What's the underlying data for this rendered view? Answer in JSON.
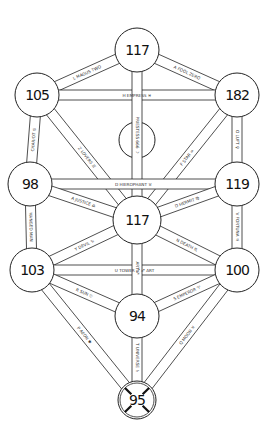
{
  "diagram": {
    "type": "tree-of-life",
    "nodes": [
      {
        "id": "n1",
        "value": "117",
        "x": 137,
        "y": 50,
        "r": 22
      },
      {
        "id": "n2",
        "value": "182",
        "x": 237,
        "y": 95,
        "r": 22
      },
      {
        "id": "n3",
        "value": "105",
        "x": 37,
        "y": 95,
        "r": 22
      },
      {
        "id": "n4",
        "value": "119",
        "x": 237,
        "y": 184,
        "r": 22
      },
      {
        "id": "n5",
        "value": "98",
        "x": 30,
        "y": 184,
        "r": 22
      },
      {
        "id": "n6",
        "value": "117",
        "x": 137,
        "y": 220,
        "r": 24
      },
      {
        "id": "n7",
        "value": "100",
        "x": 237,
        "y": 270,
        "r": 22
      },
      {
        "id": "n8",
        "value": "103",
        "x": 32,
        "y": 270,
        "r": 22
      },
      {
        "id": "n9",
        "value": "94",
        "x": 137,
        "y": 316,
        "r": 22
      },
      {
        "id": "n10",
        "value": "95",
        "x": 137,
        "y": 400,
        "r": 19
      },
      {
        "id": "daath",
        "value": "",
        "x": 137,
        "y": 140,
        "r": 18
      }
    ],
    "paths": [
      {
        "from": "n1",
        "to": "n2",
        "label": "A FOOL ZERO"
      },
      {
        "from": "n1",
        "to": "n3",
        "label": "L MAGUS TWO"
      },
      {
        "from": "n3",
        "to": "n2",
        "label": "H EMPRESS ♓"
      },
      {
        "from": "n1",
        "to": "n6",
        "label": "PRIESTESS 666 ☽"
      },
      {
        "from": "n3",
        "to": "n5",
        "label": "CHARIOT ♋"
      },
      {
        "from": "n3",
        "to": "n6",
        "label": "Z LOVERS ♊"
      },
      {
        "from": "n2",
        "to": "n4",
        "label": "O LUFT ♀"
      },
      {
        "from": "n2",
        "to": "n6",
        "label": "F STAR ♒"
      },
      {
        "from": "n5",
        "to": "n4",
        "label": "D HIEROPHANT ♉"
      },
      {
        "from": "n5",
        "to": "n6",
        "label": "A JUSTICE ♎"
      },
      {
        "from": "n4",
        "to": "n6",
        "label": "D HERMIT ♍"
      },
      {
        "from": "n5",
        "to": "n8",
        "label": "HANGED MAN"
      },
      {
        "from": "n4",
        "to": "n7",
        "label": "V FORTUNA ♃"
      },
      {
        "from": "n8",
        "to": "n6",
        "label": "Y DEVIL ♑"
      },
      {
        "from": "n7",
        "to": "n6",
        "label": "N DEATH ♏"
      },
      {
        "from": "n8",
        "to": "n7",
        "label": "U TOWER ♂ ♐ ART"
      },
      {
        "from": "n6",
        "to": "n9",
        "label": "ART ♐"
      },
      {
        "from": "n8",
        "to": "n9",
        "label": "R SUN ☉"
      },
      {
        "from": "n7",
        "to": "n9",
        "label": "S EMPEROR ♈"
      },
      {
        "from": "n8",
        "to": "n10",
        "label": "P AEON ✱"
      },
      {
        "from": "n7",
        "to": "n10",
        "label": "Q MOON ♓"
      },
      {
        "from": "n9",
        "to": "n10",
        "label": "T UNIVERSE ♄"
      }
    ]
  }
}
